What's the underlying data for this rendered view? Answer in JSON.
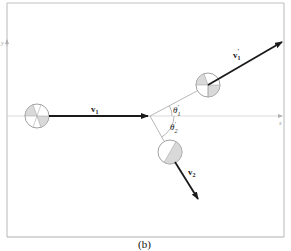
{
  "figure": {
    "caption": "(b)",
    "colors": {
      "frame": "#b8b8b8",
      "axis": "#c8c8c8",
      "guide": "#999999",
      "arrow": "#1a1a1a",
      "ball_fill": "#ffffff",
      "ball_stroke": "#888888",
      "ball_shade": "#d9d9d9"
    },
    "axes": {
      "x_label": "x",
      "y_label": "y"
    },
    "vectors": {
      "v1": {
        "base": "v",
        "sub": "1",
        "prime": ""
      },
      "v1_prime": {
        "base": "v",
        "sub": "1",
        "prime": "′"
      },
      "v2": {
        "base": "v",
        "sub": "2",
        "prime": ""
      }
    },
    "angles": {
      "theta1_prime": {
        "base": "θ",
        "sub": "1",
        "prime": "′"
      },
      "theta2_prime": {
        "base": "θ",
        "sub": "2",
        "prime": "′"
      }
    },
    "objects": [
      {
        "name": "ball-1-initial",
        "cx": 37,
        "cy": 116,
        "r": 12
      },
      {
        "name": "ball-1-final",
        "cx": 208,
        "cy": 85,
        "r": 12
      },
      {
        "name": "ball-2-final",
        "cx": 170,
        "cy": 152,
        "r": 12
      }
    ],
    "collision_point": {
      "x": 150,
      "y": 116
    }
  }
}
